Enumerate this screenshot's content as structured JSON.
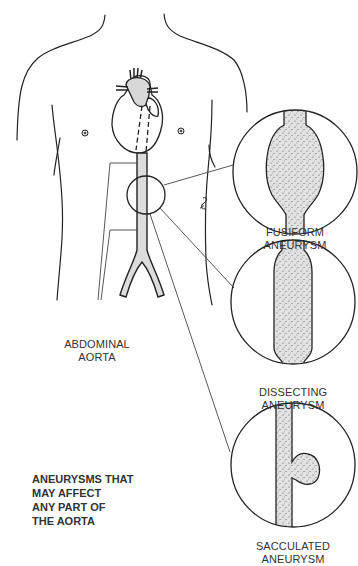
{
  "labels": {
    "abdominal_aorta": [
      "ABDOMINAL",
      "AORTA"
    ],
    "fusiform": [
      "FUSIFORM",
      "ANEURYSM"
    ],
    "dissecting": [
      "DISSECTING",
      "ANEURYSM"
    ],
    "sacculated": [
      "SACCULATED",
      "ANEURYSM"
    ]
  },
  "note": [
    "ANEURYSMS THAT",
    "MAY AFFECT",
    "ANY PART OF",
    "THE AORTA"
  ],
  "colors": {
    "line": "#222222",
    "fill": "#dcdcdc",
    "text": "#333333"
  }
}
